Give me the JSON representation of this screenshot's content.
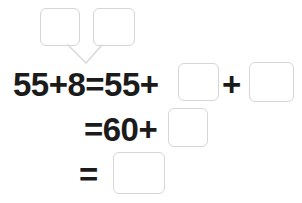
{
  "worksheet": {
    "title": "Make-a-ten addition worksheet",
    "background_color": "#ffffff",
    "text_color": "#1b1b1b",
    "box_border_color": "#d6d6d6",
    "connector_color": "#d6d6d6"
  },
  "decomposition": {
    "label": "number-bond decomposition of 8",
    "box_1_value": "",
    "box_1_placeholder": "",
    "box_2_value": "",
    "box_2_placeholder": ""
  },
  "equation": {
    "row_1": {
      "lhs_text": "55+8=55+",
      "box_1_value": "",
      "operator_text": "+",
      "box_2_value": ""
    },
    "row_2": {
      "lhs_text": "=60+",
      "box_1_value": ""
    },
    "row_3": {
      "lhs_text": "=",
      "box_1_value": ""
    }
  }
}
